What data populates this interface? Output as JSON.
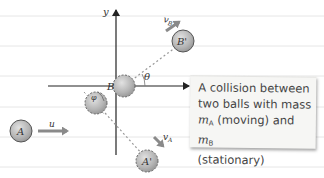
{
  "diagram": {
    "axes": {
      "y_label": "y",
      "angle_theta": "θ",
      "angle_phi": "φ"
    },
    "balls": {
      "A_initial": "A",
      "B_initial": "B",
      "A_final": "A'",
      "B_final": "B'"
    },
    "velocities": {
      "initial": "u",
      "A_final": "v",
      "A_final_sub": "A",
      "B_final": "v",
      "B_final_sub": "B"
    },
    "caption": {
      "line1": "A collision between",
      "line2": "two balls with mass",
      "mA_m": "m",
      "mA_sub": "A",
      "mid": " (moving) and ",
      "mB_m": "m",
      "mB_sub": "B",
      "line4": "(stationary)"
    },
    "colors": {
      "ball_fill": "#b9b9b9",
      "ball_stroke": "#555555",
      "arrow": "#8a8a8a",
      "axis": "#222222",
      "rule_line": "#e2e2e2"
    }
  }
}
